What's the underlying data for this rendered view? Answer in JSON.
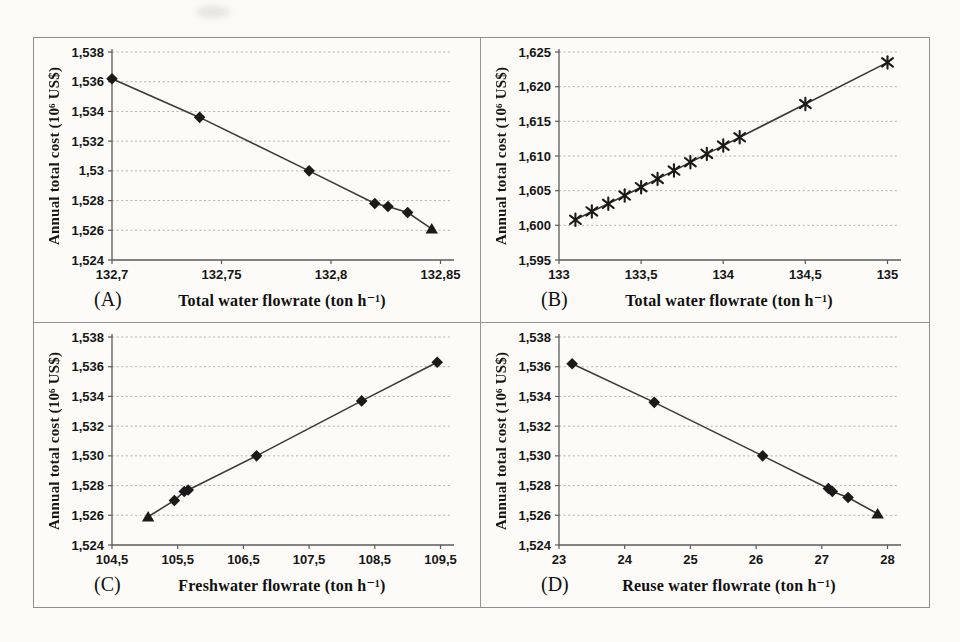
{
  "page": {
    "background": "#fbfaf7",
    "figure_border_color": "#8f8f8f",
    "grid_color": "#b3ada3",
    "axis_color": "#5a5a5a",
    "text_color": "#161616"
  },
  "chart_data": [
    {
      "type": "scatter",
      "panel_label": "(A)",
      "xlabel": "Total water flowrate (ton h⁻¹)",
      "ylabel": "Annual total cost (10⁶ US$)",
      "xlim": [
        132.7,
        132.85
      ],
      "ylim": [
        1.524,
        1.538
      ],
      "grid": "dotted-horizontal",
      "legend": "none",
      "line_color": "#3a3a3a",
      "marker_color": "#1a1a1a",
      "x_ticks": [
        {
          "v": 132.7,
          "label": "132,7"
        },
        {
          "v": 132.75,
          "label": "132,75"
        },
        {
          "v": 132.8,
          "label": "132,8"
        },
        {
          "v": 132.85,
          "label": "132,85"
        }
      ],
      "y_ticks": [
        {
          "v": 1.524,
          "label": "1,524"
        },
        {
          "v": 1.526,
          "label": "1,526"
        },
        {
          "v": 1.528,
          "label": "1,528"
        },
        {
          "v": 1.53,
          "label": "1,53"
        },
        {
          "v": 1.532,
          "label": "1,532"
        },
        {
          "v": 1.534,
          "label": "1,534"
        },
        {
          "v": 1.536,
          "label": "1,536"
        },
        {
          "v": 1.538,
          "label": "1,538"
        }
      ],
      "points": [
        {
          "x": 132.7,
          "y": 1.5362,
          "m": "diamond"
        },
        {
          "x": 132.74,
          "y": 1.5336,
          "m": "diamond"
        },
        {
          "x": 132.79,
          "y": 1.53,
          "m": "diamond"
        },
        {
          "x": 132.82,
          "y": 1.5278,
          "m": "diamond"
        },
        {
          "x": 132.826,
          "y": 1.5276,
          "m": "diamond"
        },
        {
          "x": 132.835,
          "y": 1.5272,
          "m": "diamond"
        },
        {
          "x": 132.846,
          "y": 1.5261,
          "m": "triangle"
        }
      ]
    },
    {
      "type": "scatter",
      "panel_label": "(B)",
      "xlabel": "Total water flowrate (ton h⁻¹)",
      "ylabel": "Annual total cost (10⁶ US$)",
      "xlim": [
        133,
        135
      ],
      "ylim": [
        1.595,
        1.625
      ],
      "grid": "dotted-horizontal",
      "legend": "none",
      "line_color": "#3a3a3a",
      "marker_color": "#1a1a1a",
      "x_ticks": [
        {
          "v": 133,
          "label": "133"
        },
        {
          "v": 133.5,
          "label": "133,5"
        },
        {
          "v": 134,
          "label": "134"
        },
        {
          "v": 134.5,
          "label": "134,5"
        },
        {
          "v": 135,
          "label": "135"
        }
      ],
      "y_ticks": [
        {
          "v": 1.595,
          "label": "1,595"
        },
        {
          "v": 1.6,
          "label": "1,600"
        },
        {
          "v": 1.605,
          "label": "1,605"
        },
        {
          "v": 1.61,
          "label": "1,610"
        },
        {
          "v": 1.615,
          "label": "1,615"
        },
        {
          "v": 1.62,
          "label": "1,620"
        },
        {
          "v": 1.625,
          "label": "1,625"
        }
      ],
      "points": [
        {
          "x": 133.1,
          "y": 1.6008,
          "m": "asterisk"
        },
        {
          "x": 133.2,
          "y": 1.602,
          "m": "asterisk"
        },
        {
          "x": 133.3,
          "y": 1.6031,
          "m": "asterisk"
        },
        {
          "x": 133.4,
          "y": 1.6043,
          "m": "asterisk"
        },
        {
          "x": 133.5,
          "y": 1.6055,
          "m": "asterisk"
        },
        {
          "x": 133.6,
          "y": 1.6067,
          "m": "asterisk"
        },
        {
          "x": 133.7,
          "y": 1.6079,
          "m": "asterisk"
        },
        {
          "x": 133.8,
          "y": 1.6091,
          "m": "asterisk"
        },
        {
          "x": 133.9,
          "y": 1.6103,
          "m": "asterisk"
        },
        {
          "x": 134.0,
          "y": 1.6115,
          "m": "asterisk"
        },
        {
          "x": 134.1,
          "y": 1.6127,
          "m": "asterisk"
        },
        {
          "x": 134.5,
          "y": 1.6175,
          "m": "asterisk"
        },
        {
          "x": 135.0,
          "y": 1.6235,
          "m": "asterisk"
        }
      ]
    },
    {
      "type": "scatter",
      "panel_label": "(C)",
      "xlabel": "Freshwater flowrate (ton h⁻¹)",
      "ylabel": "Annual total cost (10⁶ US$)",
      "xlim": [
        104.5,
        109.5
      ],
      "ylim": [
        1.524,
        1.538
      ],
      "grid": "dotted-horizontal",
      "legend": "none",
      "line_color": "#3a3a3a",
      "marker_color": "#1a1a1a",
      "x_ticks": [
        {
          "v": 104.5,
          "label": "104,5"
        },
        {
          "v": 105.5,
          "label": "105,5"
        },
        {
          "v": 106.5,
          "label": "106,5"
        },
        {
          "v": 107.5,
          "label": "107,5"
        },
        {
          "v": 108.5,
          "label": "108,5"
        },
        {
          "v": 109.5,
          "label": "109,5"
        }
      ],
      "y_ticks": [
        {
          "v": 1.524,
          "label": "1,524"
        },
        {
          "v": 1.526,
          "label": "1,526"
        },
        {
          "v": 1.528,
          "label": "1,528"
        },
        {
          "v": 1.53,
          "label": "1,530"
        },
        {
          "v": 1.532,
          "label": "1,532"
        },
        {
          "v": 1.534,
          "label": "1,534"
        },
        {
          "v": 1.536,
          "label": "1,536"
        },
        {
          "v": 1.538,
          "label": "1,538"
        }
      ],
      "points": [
        {
          "x": 105.05,
          "y": 1.5259,
          "m": "triangle"
        },
        {
          "x": 105.45,
          "y": 1.527,
          "m": "diamond"
        },
        {
          "x": 105.6,
          "y": 1.5276,
          "m": "diamond"
        },
        {
          "x": 105.66,
          "y": 1.5277,
          "m": "diamond"
        },
        {
          "x": 106.7,
          "y": 1.53,
          "m": "diamond"
        },
        {
          "x": 108.3,
          "y": 1.5337,
          "m": "diamond"
        },
        {
          "x": 109.45,
          "y": 1.5363,
          "m": "diamond"
        }
      ]
    },
    {
      "type": "scatter",
      "panel_label": "(D)",
      "xlabel": "Reuse water flowrate (ton h⁻¹)",
      "ylabel": "Annual total cost (10⁶ US$)",
      "xlim": [
        23,
        28
      ],
      "ylim": [
        1.524,
        1.538
      ],
      "grid": "dotted-horizontal",
      "legend": "none",
      "line_color": "#3a3a3a",
      "marker_color": "#1a1a1a",
      "x_ticks": [
        {
          "v": 23,
          "label": "23"
        },
        {
          "v": 24,
          "label": "24"
        },
        {
          "v": 25,
          "label": "25"
        },
        {
          "v": 26,
          "label": "26"
        },
        {
          "v": 27,
          "label": "27"
        },
        {
          "v": 28,
          "label": "28"
        }
      ],
      "y_ticks": [
        {
          "v": 1.524,
          "label": "1,524"
        },
        {
          "v": 1.526,
          "label": "1,526"
        },
        {
          "v": 1.528,
          "label": "1,528"
        },
        {
          "v": 1.53,
          "label": "1,530"
        },
        {
          "v": 1.532,
          "label": "1,532"
        },
        {
          "v": 1.534,
          "label": "1,534"
        },
        {
          "v": 1.536,
          "label": "1,536"
        },
        {
          "v": 1.538,
          "label": "1,538"
        }
      ],
      "points": [
        {
          "x": 23.2,
          "y": 1.5362,
          "m": "diamond"
        },
        {
          "x": 24.45,
          "y": 1.5336,
          "m": "diamond"
        },
        {
          "x": 26.1,
          "y": 1.53,
          "m": "diamond"
        },
        {
          "x": 27.1,
          "y": 1.5278,
          "m": "diamond"
        },
        {
          "x": 27.16,
          "y": 1.5276,
          "m": "diamond"
        },
        {
          "x": 27.4,
          "y": 1.5272,
          "m": "diamond"
        },
        {
          "x": 27.85,
          "y": 1.5261,
          "m": "triangle"
        }
      ]
    }
  ]
}
